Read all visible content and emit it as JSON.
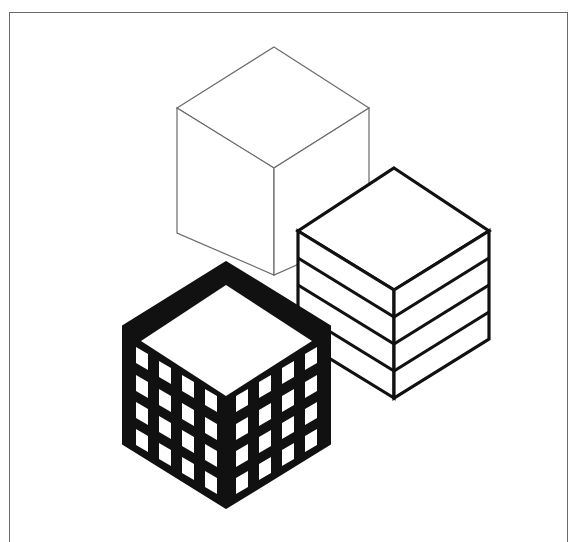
{
  "figure": {
    "description": "Three isometric cubes illustration",
    "colors": {
      "background": "#ffffff",
      "frame": "#6a6a6a",
      "ink": "#111111",
      "thin_line": "#6a6a6a"
    },
    "cubes": [
      {
        "id": "outline-cube",
        "style": "thin outline",
        "label": "Plain wireframe cube"
      },
      {
        "id": "layered-cube",
        "style": "bold outline with 4 horizontal layers",
        "label": "Layered / striped cube",
        "layers": 4
      },
      {
        "id": "grid-cube",
        "style": "solid black with window grid",
        "label": "Building cube with windows",
        "window_rows": 4,
        "window_cols_per_face": 4
      }
    ]
  }
}
